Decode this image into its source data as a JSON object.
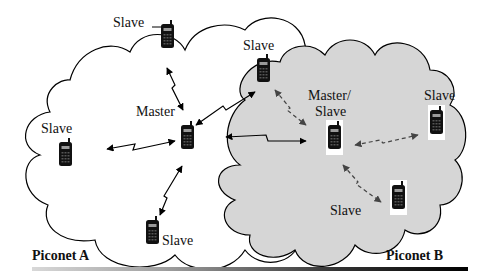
{
  "diagram": {
    "type": "bluetooth-scatternet",
    "piconets": [
      {
        "id": "A",
        "label": "Piconet A",
        "fill": "#ffffff"
      },
      {
        "id": "B",
        "label": "Piconet B",
        "fill": "#d6d6d6"
      }
    ],
    "nodes": [
      {
        "id": "a_top",
        "label": "Slave",
        "role": "slave",
        "piconet": "A"
      },
      {
        "id": "a_left",
        "label": "Slave",
        "role": "slave",
        "piconet": "A"
      },
      {
        "id": "a_master",
        "label": "Master",
        "role": "master",
        "piconet": "A"
      },
      {
        "id": "a_bottom",
        "label": "Slave",
        "role": "slave",
        "piconet": "A"
      },
      {
        "id": "ab_slave",
        "label": "Slave",
        "role": "slave",
        "piconet": "A/B"
      },
      {
        "id": "b_master",
        "label_line1": "Master/",
        "label_line2": "Slave",
        "role": "master-slave",
        "piconet": "A/B"
      },
      {
        "id": "b_right",
        "label": "Slave",
        "role": "slave",
        "piconet": "B"
      },
      {
        "id": "b_bottom",
        "label": "Slave",
        "role": "slave",
        "piconet": "B"
      }
    ],
    "links": [
      {
        "from": "a_master",
        "to": "a_top",
        "style": "solid"
      },
      {
        "from": "a_master",
        "to": "a_left",
        "style": "solid"
      },
      {
        "from": "a_master",
        "to": "a_bottom",
        "style": "solid"
      },
      {
        "from": "a_master",
        "to": "ab_slave",
        "style": "solid"
      },
      {
        "from": "a_master",
        "to": "b_master",
        "style": "solid"
      },
      {
        "from": "b_master",
        "to": "ab_slave",
        "style": "dashed"
      },
      {
        "from": "b_master",
        "to": "b_right",
        "style": "dashed"
      },
      {
        "from": "b_master",
        "to": "b_bottom",
        "style": "dashed"
      }
    ],
    "colors": {
      "line": "#000000",
      "cloud_b": "#d6d6d6",
      "phone": "#111111",
      "screen": "#9a9a9a"
    }
  },
  "labels": {
    "a_top": "Slave",
    "ab_slave": "Slave",
    "a_master": "Master",
    "a_left": "Slave",
    "b_master_1": "Master/",
    "b_master_2": "Slave",
    "b_right": "Slave",
    "b_bottom": "Slave",
    "a_bottom": "Slave",
    "piconet_a": "Piconet A",
    "piconet_b": "Piconet B"
  }
}
